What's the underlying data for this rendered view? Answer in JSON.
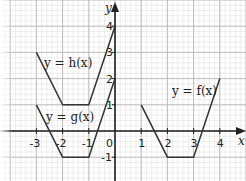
{
  "chart_data": {
    "type": "line",
    "title": "",
    "xlabel": "x",
    "ylabel": "y",
    "xlim": [
      -4.4,
      5.0
    ],
    "ylim": [
      -1.9,
      5.0
    ],
    "grid": true,
    "x_ticks": [
      "-3",
      "-2",
      "-1",
      "0",
      "1",
      "2",
      "3",
      "4"
    ],
    "y_ticks": [
      "4",
      "3",
      "2",
      "1",
      "-1"
    ],
    "series": [
      {
        "name": "y = h(x)",
        "points": [
          [
            -3,
            3
          ],
          [
            -2,
            1
          ],
          [
            -1,
            1
          ],
          [
            0,
            4
          ]
        ]
      },
      {
        "name": "y = g(x)",
        "points": [
          [
            -3,
            1
          ],
          [
            -2,
            -1
          ],
          [
            -1,
            -1
          ],
          [
            0,
            2
          ]
        ]
      },
      {
        "name": "y = f(x)",
        "points": [
          [
            1,
            1
          ],
          [
            2,
            -1
          ],
          [
            3,
            -1
          ],
          [
            4,
            2
          ]
        ]
      }
    ],
    "annotations": [
      "y = h(x)",
      "y = g(x)",
      "y = f(x)"
    ]
  },
  "labels": {
    "h": "y = h(x)",
    "g": "y = g(x)",
    "f": "y = f(x)",
    "x_axis": "x",
    "y_axis": "y",
    "origin": "0"
  },
  "colors": {
    "grid_major": "#b8b8b8",
    "grid_minor": "#e2e2e2",
    "axis": "#222222",
    "curve": "#333333"
  }
}
